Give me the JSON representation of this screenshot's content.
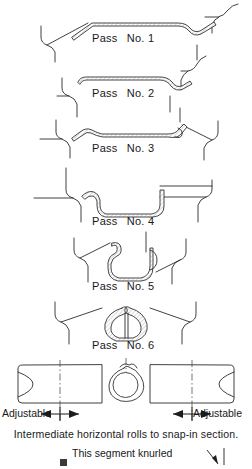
{
  "figure": {
    "title_visible": false,
    "passes": [
      {
        "id": 1,
        "label": "Pass",
        "number": "No. 1",
        "label_x": 92,
        "label_y": 32
      },
      {
        "id": 2,
        "label": "Pass",
        "number": "No. 2",
        "label_x": 92,
        "label_y": 87
      },
      {
        "id": 3,
        "label": "Pass",
        "number": "No. 3",
        "label_x": 92,
        "label_y": 142
      },
      {
        "id": 4,
        "label": "Pass",
        "number": "No. 4",
        "label_x": 92,
        "label_y": 215
      },
      {
        "id": 5,
        "label": "Pass",
        "number": "No. 5",
        "label_x": 92,
        "label_y": 280
      },
      {
        "id": 6,
        "label": "Pass",
        "number": "No. 6",
        "label_x": 92,
        "label_y": 339
      }
    ],
    "roll_assembly": {
      "left_dimension_label": "Adjustable",
      "right_dimension_label": "Adjustable",
      "caption": "Intermediate horizontal rolls to snap-in section."
    },
    "knurl_note": "This segment knurled"
  },
  "colors": {
    "background": "#ffffff",
    "line": "#2b2b2b",
    "strip_fill": "#ffffff",
    "hatch": "#555555",
    "centerline": "#3a3a3a",
    "text": "#17181a"
  }
}
